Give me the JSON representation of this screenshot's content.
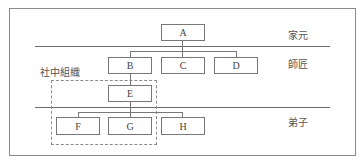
{
  "diagram": {
    "type": "hierarchy",
    "levels": [
      {
        "label": "家元"
      },
      {
        "label": "師匠"
      },
      {
        "label": "弟子"
      }
    ],
    "group_label": "社中組織",
    "nodes": {
      "A": "A",
      "B": "B",
      "C": "C",
      "D": "D",
      "E": "E",
      "F": "F",
      "G": "G",
      "H": "H"
    },
    "edges": [
      [
        "A",
        "B"
      ],
      [
        "A",
        "C"
      ],
      [
        "A",
        "D"
      ],
      [
        "B",
        "E"
      ],
      [
        "E",
        "F"
      ],
      [
        "E",
        "G"
      ],
      [
        "E",
        "H"
      ]
    ],
    "group_members": [
      "E",
      "F",
      "G"
    ]
  }
}
